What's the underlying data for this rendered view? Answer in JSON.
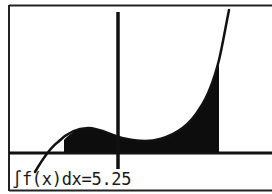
{
  "calculator": {
    "screen": "graph",
    "result": {
      "label": "∫f(x)dx=5.25",
      "integral_symbol": "∫",
      "expression": "f(x)dx",
      "value": "5.25"
    },
    "graph": {
      "function": "f(x)",
      "shaded_region": "integral from lower to upper bound",
      "axes": [
        "x-axis",
        "y-axis"
      ]
    },
    "colors": {
      "background": "#ffffff",
      "ink": "#111111"
    }
  }
}
